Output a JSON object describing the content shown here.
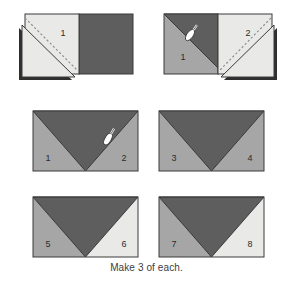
{
  "page": {
    "caption": "Make 3 of each."
  },
  "colors": {
    "fabric_light": "#e9e9e7",
    "fabric_medium": "#a6a6a6",
    "fabric_dark": "#5e5e5e",
    "outline": "#3a3a3a",
    "stitch_line": "#8f8f8f",
    "shadow": "#2e2e2e",
    "background": "#ffffff",
    "label_text_on_light": "#2b2b2b",
    "label_text_on_dark": "#e8e8e8"
  },
  "steps": [
    {
      "id": "step-top-left",
      "name": "fold-unit-left",
      "labels": [
        "1"
      ],
      "has_pin": false,
      "has_stitch_line": true,
      "description": "Light square folded back along diagonal over dark square"
    },
    {
      "id": "step-top-right",
      "name": "fold-unit-right",
      "labels": [
        "1",
        "2"
      ],
      "has_pin": true,
      "has_stitch_line": true,
      "description": "Second light square folded back with pin at center seam"
    },
    {
      "id": "step-mid-left",
      "name": "finished-unit-a",
      "labels": [
        "1",
        "2"
      ],
      "has_pin": true,
      "has_stitch_line": false,
      "description": "Completed flying geese unit with medium corners"
    },
    {
      "id": "step-mid-right",
      "name": "finished-unit-b",
      "labels": [
        "3",
        "4"
      ],
      "has_pin": false,
      "has_stitch_line": false,
      "description": "Completed flying geese unit with medium corners"
    },
    {
      "id": "step-bottom-left",
      "name": "finished-unit-c",
      "labels": [
        "5",
        "6"
      ],
      "has_pin": false,
      "has_stitch_line": false,
      "description": "Completed flying geese unit, left corner medium, right corner light"
    },
    {
      "id": "step-bottom-right",
      "name": "finished-unit-d",
      "labels": [
        "7",
        "8"
      ],
      "has_pin": false,
      "has_stitch_line": false,
      "description": "Completed flying geese unit, left corner medium, right corner light"
    }
  ],
  "labels": {
    "n1": "1",
    "n2": "2",
    "n3": "3",
    "n4": "4",
    "n5": "5",
    "n6": "6",
    "n7": "7",
    "n8": "8"
  },
  "icons": {
    "pin": "straight-pin-icon"
  }
}
